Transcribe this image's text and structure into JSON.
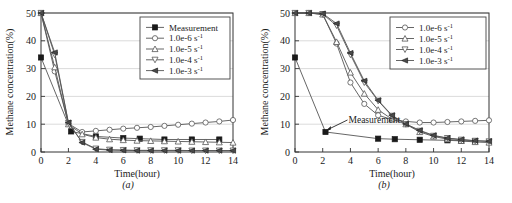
{
  "figure": {
    "panels": [
      {
        "caption": "(a)",
        "xlabel": "Time(hour)",
        "ylabel": "Methane concentration(%)",
        "legend_position": "top-right"
      },
      {
        "caption": "(b)",
        "xlabel": "Time(hour)",
        "ylabel": "Methane concentration(%)",
        "legend_position": "top-right",
        "annotation": "Measurement"
      }
    ]
  },
  "axis": {
    "xticks": [
      "0",
      "2",
      "4",
      "6",
      "8",
      "10",
      "12",
      "14"
    ],
    "yticks": [
      "0",
      "10",
      "20",
      "30",
      "40",
      "50"
    ]
  },
  "legend": {
    "measurement": "Measurement",
    "e6_base": "1.0e-6 s",
    "e5_base": "1.0e-5 s",
    "e4_base": "1.0e-4 s",
    "e3_base": "1.0e-3 s",
    "exponent": "-1"
  },
  "colors": {
    "line": "#555555",
    "marker_fill": "#1a1a1a",
    "marker_open": "#ffffff",
    "grid": "#cccccc",
    "axis": "#333333",
    "legend_border": "#444444"
  },
  "chart_data": [
    {
      "type": "line",
      "title": "(a)",
      "xlabel": "Time(hour)",
      "ylabel": "Methane concentration(%)",
      "xlim": [
        0,
        14
      ],
      "ylim": [
        0,
        50
      ],
      "xticks": [
        0,
        2,
        4,
        6,
        8,
        10,
        12,
        14
      ],
      "yticks": [
        0,
        10,
        20,
        30,
        40,
        50
      ],
      "grid": true,
      "legend_position": "top-right",
      "series": [
        {
          "name": "Measurement",
          "marker": "filled-square",
          "x": [
            0,
            2.2,
            4,
            6,
            7.2,
            9,
            11,
            13
          ],
          "y": [
            34.0,
            7.4,
            5.6,
            5.0,
            4.8,
            4.5,
            4.5,
            4.5
          ]
        },
        {
          "name": "1.0e-6 s^-1",
          "marker": "open-circle",
          "x": [
            0,
            1,
            2,
            3,
            4,
            5,
            6,
            7,
            8,
            9,
            10,
            11,
            12,
            13,
            14
          ],
          "y": [
            50.0,
            29.0,
            10.2,
            7.2,
            7.6,
            8.0,
            8.4,
            8.7,
            9.0,
            9.4,
            9.8,
            10.2,
            10.6,
            11.0,
            11.5
          ]
        },
        {
          "name": "1.0e-5 s^-1",
          "marker": "open-up-triangle",
          "x": [
            0,
            1,
            2,
            3,
            4,
            5,
            6,
            7,
            8,
            9,
            10,
            11,
            12,
            13,
            14
          ],
          "y": [
            50.0,
            30.5,
            10.0,
            6.4,
            5.2,
            4.6,
            4.3,
            4.1,
            4.0,
            3.9,
            3.8,
            3.7,
            3.6,
            3.5,
            3.4
          ]
        },
        {
          "name": "1.0e-4 s^-1",
          "marker": "open-down-triangle",
          "x": [
            0,
            1,
            2,
            3,
            4,
            5,
            6,
            7,
            8,
            9,
            10,
            11,
            12,
            13,
            14
          ],
          "y": [
            50.0,
            35.0,
            10.4,
            3.6,
            1.2,
            0.8,
            0.7,
            0.6,
            0.6,
            0.6,
            0.6,
            0.5,
            0.5,
            0.5,
            0.5
          ]
        },
        {
          "name": "1.0e-3 s^-1",
          "marker": "filled-left-triangle",
          "x": [
            0,
            1,
            2,
            3,
            4,
            5,
            6,
            7,
            8,
            9,
            10,
            11,
            12,
            13,
            14
          ],
          "y": [
            50.0,
            35.8,
            10.6,
            3.4,
            1.0,
            0.7,
            0.6,
            0.5,
            0.5,
            0.5,
            0.5,
            0.5,
            0.5,
            0.5,
            0.5
          ]
        }
      ]
    },
    {
      "type": "line",
      "title": "(b)",
      "xlabel": "Time(hour)",
      "ylabel": "Methane concentration(%)",
      "xlim": [
        0,
        14
      ],
      "ylim": [
        0,
        50
      ],
      "xticks": [
        0,
        2,
        4,
        6,
        8,
        10,
        12,
        14
      ],
      "yticks": [
        0,
        10,
        20,
        30,
        40,
        50
      ],
      "grid": true,
      "legend_position": "top-right",
      "annotation": {
        "text": "Measurement",
        "points_to_x": 2.2,
        "points_to_y": 7.2
      },
      "series": [
        {
          "name": "Measurement",
          "marker": "filled-square",
          "x": [
            0,
            2.2,
            6,
            7.2,
            9,
            11,
            12,
            13
          ],
          "y": [
            34.0,
            7.2,
            4.8,
            4.6,
            4.4,
            4.2,
            4.0,
            3.9
          ]
        },
        {
          "name": "1.0e-6 s^-1",
          "marker": "open-circle",
          "x": [
            0,
            1,
            2,
            3,
            4,
            5,
            6,
            7,
            8,
            9,
            10,
            11,
            12,
            13,
            14
          ],
          "y": [
            50.0,
            50.0,
            49.5,
            39.0,
            25.0,
            17.3,
            13.2,
            11.7,
            11.0,
            10.6,
            10.6,
            10.8,
            11.0,
            11.2,
            11.4
          ]
        },
        {
          "name": "1.0e-5 s^-1",
          "marker": "open-up-triangle",
          "x": [
            0,
            1,
            2,
            3,
            4,
            5,
            6,
            7,
            8,
            9,
            10,
            11,
            12,
            13,
            14
          ],
          "y": [
            50.0,
            50.0,
            49.5,
            39.6,
            28.6,
            21.0,
            15.2,
            11.8,
            10.0,
            7.2,
            5.6,
            4.6,
            4.0,
            3.6,
            3.4
          ]
        },
        {
          "name": "1.0e-4 s^-1",
          "marker": "open-down-triangle",
          "x": [
            0,
            1,
            2,
            3,
            4,
            5,
            6,
            7,
            8,
            9,
            10,
            11,
            12,
            13,
            14
          ],
          "y": [
            50.0,
            50.0,
            49.6,
            45.5,
            35.0,
            25.0,
            18.4,
            13.0,
            10.0,
            7.6,
            5.8,
            5.0,
            4.4,
            4.0,
            3.8
          ]
        },
        {
          "name": "1.0e-3 s^-1",
          "marker": "filled-left-triangle",
          "x": [
            0,
            1,
            2,
            3,
            4,
            5,
            6,
            7,
            8,
            9,
            10,
            11,
            12,
            13,
            14
          ],
          "y": [
            50.0,
            50.0,
            49.8,
            46.2,
            35.6,
            25.6,
            18.6,
            13.2,
            10.1,
            7.8,
            6.0,
            5.0,
            4.5,
            4.1,
            3.9
          ]
        }
      ]
    }
  ]
}
